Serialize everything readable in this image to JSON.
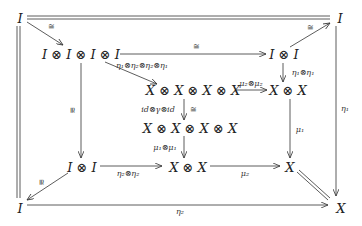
{
  "diagram": {
    "type": "commutative-diagram",
    "nodes": {
      "tl": "I",
      "tr": "I",
      "bl": "I",
      "br": "X",
      "i4": "I ⊗ I ⊗ I ⊗ I",
      "i2top": "I ⊗ I",
      "x4a": "X ⊗ X ⊗ X ⊗ X",
      "x2right": "X ⊗ X",
      "x4b": "X ⊗ X ⊗ X ⊗ X",
      "i2bot": "I ⊗ I",
      "x2bot": "X ⊗ X",
      "xmid": "X"
    },
    "labels": {
      "tl_i4": "≅",
      "i2top_tr": "≅",
      "i4_i2top": "≅",
      "i4_x4a": "η₁⊗η₂⊗η₂⊗η₁",
      "i2top_x2right": "η₁⊗η₁",
      "x4a_x2right": "μ₂⊗μ₂",
      "x4a_x4b_left": "id⊗γ⊗id",
      "x4a_x4b_right": "≅",
      "x4b_x2bot": "μ₁⊗μ₁",
      "i4_i2bot": "≅",
      "x2right_xmid": "μ₁",
      "tr_br": "η₁",
      "i2bot_x2bot": "η₂⊗η₂",
      "x2bot_xmid": "μ₂",
      "i2bot_bl": "≅",
      "bl_br": "η₂"
    }
  }
}
